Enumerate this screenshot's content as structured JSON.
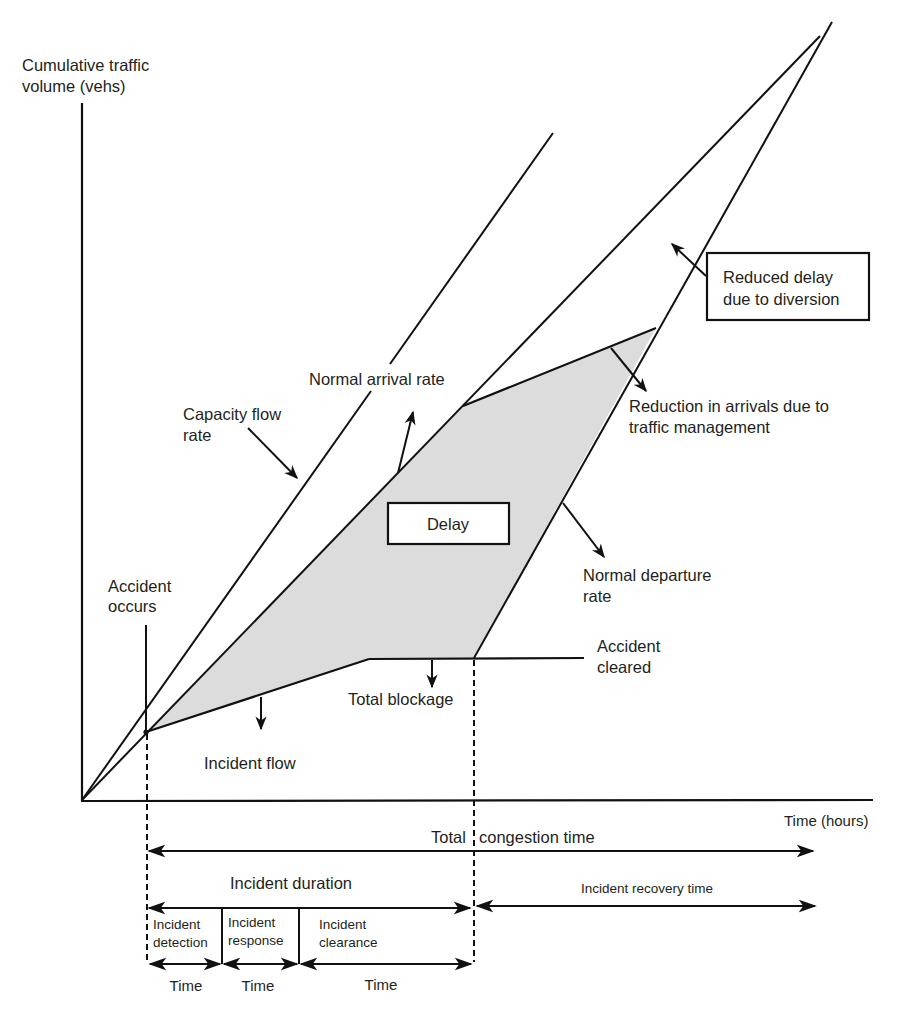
{
  "colors": {
    "ink": "#111111",
    "text": "#231f20",
    "delay_fill": "#dcdcdc",
    "background": "#ffffff"
  },
  "axes": {
    "y_label_line1": "Cumulative traffic",
    "y_label_line2": "volume (vehs)",
    "x_label": "Time (hours)"
  },
  "curves": {
    "capacity_flow_rate": {
      "label_line1": "Capacity flow",
      "label_line2": "rate"
    },
    "normal_arrival_rate": {
      "label": "Normal arrival rate"
    },
    "normal_departure_rate": {
      "label_line1": "Normal departure",
      "label_line2": "rate"
    },
    "incident_flow": {
      "label": "Incident flow"
    },
    "total_blockage": {
      "label": "Total blockage"
    },
    "reduced_arrivals": {
      "label_line1": "Reduction in arrivals due to",
      "label_line2": "traffic management"
    }
  },
  "events": {
    "accident_occurs": {
      "line1": "Accident",
      "line2": "occurs"
    },
    "accident_cleared": {
      "line1": "Accident",
      "line2": "cleared"
    }
  },
  "boxes": {
    "delay": "Delay",
    "reduced_delay_line1": "Reduced delay",
    "reduced_delay_line2": "due to diversion"
  },
  "timeline": {
    "total_congestion_part1": "Total",
    "total_congestion_part2": "congestion time",
    "incident_duration": "Incident duration",
    "incident_recovery_time": "Incident recovery time",
    "phases": [
      {
        "line1": "Incident",
        "line2": "detection",
        "time": "Time"
      },
      {
        "line1": "Incident",
        "line2": "response",
        "time": "Time"
      },
      {
        "line1": "Incident",
        "line2": "clearance",
        "time": "Time"
      }
    ]
  }
}
